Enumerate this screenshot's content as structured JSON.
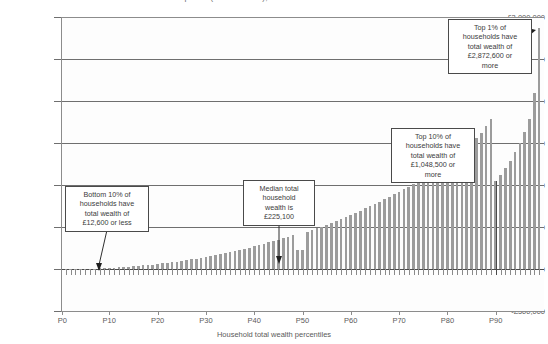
{
  "chart_data": {
    "type": "bar",
    "title": "points (Great Britain), June 2022 to June 2024",
    "xlabel": "Household total wealth percentiles",
    "ylabel": "",
    "ylim": [
      -500000,
      3000000
    ],
    "ytick_labels": [
      "£3,000,000",
      "£2,500,000",
      "£2,000,000",
      "£1,500,000",
      "£1,000,000",
      "£500,000",
      "£0",
      "-£500,000"
    ],
    "ytick_values": [
      3000000,
      2500000,
      2000000,
      1500000,
      1000000,
      500000,
      0,
      -500000
    ],
    "xtick_labels": [
      "P0",
      "P10",
      "P20",
      "P30",
      "P40",
      "P50",
      "P60",
      "P70",
      "P80",
      "P90"
    ],
    "xtick_values": [
      0,
      10,
      20,
      30,
      40,
      50,
      60,
      70,
      80,
      90
    ],
    "grid": true,
    "legend": "none",
    "bar_color": "#9c9c9c",
    "categories": [
      "P1",
      "P2",
      "P3",
      "P4",
      "P5",
      "P6",
      "P7",
      "P8",
      "P9",
      "P10",
      "P11",
      "P12",
      "P13",
      "P14",
      "P15",
      "P16",
      "P17",
      "P18",
      "P19",
      "P20",
      "P21",
      "P22",
      "P23",
      "P24",
      "P25",
      "P26",
      "P27",
      "P28",
      "P29",
      "P30",
      "P31",
      "P32",
      "P33",
      "P34",
      "P35",
      "P36",
      "P37",
      "P38",
      "P39",
      "P40",
      "P41",
      "P42",
      "P43",
      "P44",
      "P45",
      "P46",
      "P47",
      "P48",
      "P49",
      "P50",
      "P51",
      "P52",
      "P53",
      "P54",
      "P55",
      "P56",
      "P57",
      "P58",
      "P59",
      "P60",
      "P61",
      "P62",
      "P63",
      "P64",
      "P65",
      "P66",
      "P67",
      "P68",
      "P69",
      "P70",
      "P71",
      "P72",
      "P73",
      "P74",
      "P75",
      "P76",
      "P77",
      "P78",
      "P79",
      "P80",
      "P81",
      "P82",
      "P83",
      "P84",
      "P85",
      "P86",
      "P87",
      "P88",
      "P89",
      "P90",
      "P91",
      "P92",
      "P93",
      "P94",
      "P95",
      "P96",
      "P97",
      "P98",
      "P99"
    ],
    "values": [
      300,
      700,
      1200,
      1800,
      2600,
      3600,
      5000,
      7000,
      9600,
      12600,
      16000,
      19500,
      23500,
      27500,
      32000,
      37000,
      42000,
      47500,
      53500,
      60000,
      66500,
      73500,
      81000,
      89000,
      97000,
      105500,
      114500,
      124000,
      134000,
      144500,
      155000,
      166000,
      177500,
      189500,
      201500,
      214000,
      227000,
      240500,
      254500,
      269000,
      284000,
      299500,
      315500,
      332000,
      349000,
      366500,
      384500,
      403000,
      222000,
      225100,
      442500,
      463000,
      484000,
      505500,
      527500,
      550000,
      573000,
      596500,
      620500,
      645000,
      670000,
      695500,
      721500,
      748000,
      775000,
      802500,
      830500,
      859000,
      888000,
      917500,
      947500,
      978000,
      1009000,
      1040500,
      1072500,
      1105000,
      1138000,
      1171500,
      1205500,
      1240000,
      1280000,
      1325000,
      1375000,
      1430000,
      1490000,
      1555000,
      1625000,
      1700000,
      1780000,
      1048500,
      1120000,
      1200000,
      1290000,
      1390000,
      1500000,
      1630000,
      1790000,
      2100000,
      2872600
    ],
    "annotations": [
      {
        "id": "bottom-10",
        "text": "Bottom 10% of households have total wealth of £12,600 or less",
        "value": 12600,
        "percentile": 10
      },
      {
        "id": "median",
        "text": "Median total household wealth is £225,100",
        "value": 225100,
        "percentile": 50
      },
      {
        "id": "top-10",
        "text": "Top 10% of households have total wealth of £1,048,500 or more",
        "value": 1048500,
        "percentile": 90
      },
      {
        "id": "top-1",
        "text": "Top 1% of households have total wealth of £2,872,600 or more",
        "value": 2872600,
        "percentile": 99
      }
    ]
  },
  "annotation_boxes": {
    "bottom10": {
      "line1": "Bottom 10% of",
      "line2": "households have",
      "line3": "total wealth of",
      "line4": "£12,600 or less"
    },
    "median": {
      "line1": "Median total",
      "line2": "household",
      "line3": "wealth is",
      "line4": "£225,100"
    },
    "top10": {
      "line1": "Top 10% of",
      "line2": "households have",
      "line3": "total wealth of",
      "line4": "£1,048,500 or",
      "line5": "more"
    },
    "top1": {
      "line1": "Top 1% of",
      "line2": "households have",
      "line3": "total wealth of",
      "line4": "£2,872,600 or",
      "line5": "more"
    }
  }
}
